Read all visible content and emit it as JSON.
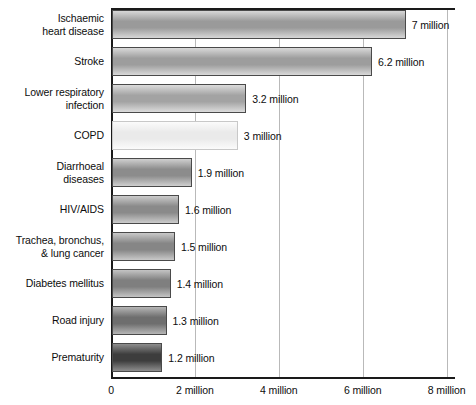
{
  "chart_data": {
    "type": "bar",
    "orientation": "horizontal",
    "title": "",
    "subtitle": "",
    "xlabel": "",
    "ylabel": "",
    "xlim": [
      0,
      8.2
    ],
    "xunit": "million",
    "grid": true,
    "legend": false,
    "categories": [
      "Ischaemic\nheart disease",
      "Stroke",
      "Lower respiratory\ninfection",
      "COPD",
      "Diarrhoeal\ndiseases",
      "HIV/AIDS",
      "Trachea, bronchus,\n& lung cancer",
      "Diabetes mellitus",
      "Road injury",
      "Prematurity"
    ],
    "values": [
      7,
      6.2,
      3.2,
      3,
      1.9,
      1.6,
      1.5,
      1.4,
      1.3,
      1.2
    ],
    "value_labels": [
      "7 million",
      "6.2 million",
      "3.2 million",
      "3 million",
      "1.9 million",
      "1.6 million",
      "1.5 million",
      "1.4 million",
      "1.3 million",
      "1.2 million"
    ],
    "bar_fill_mid": [
      "#9a9a9a",
      "#9d9d9d",
      "#a3a3a3",
      "#eaeaea",
      "#8c8c8c",
      "#8a8a8a",
      "#868686",
      "#7f7f7f",
      "#6e6e6e",
      "#3d3d3d"
    ],
    "bar_fill_edge": [
      "#d7d7d7",
      "#d9d9d9",
      "#dcdcdc",
      "#fbfbfb",
      "#cfcfcf",
      "#cccccc",
      "#c9c9c9",
      "#c4c4c4",
      "#b6b6b6",
      "#8e8e8e"
    ],
    "xticks": [
      0,
      2,
      4,
      6,
      8
    ],
    "xtick_labels": [
      "0",
      "2 million",
      "4 million",
      "6 million",
      "8 million"
    ],
    "gridline_values": [
      2,
      4,
      6,
      8
    ],
    "axis_color": "#1a1a1a",
    "grid_color": "#b9b9b9",
    "text_color": "#0d0d0d",
    "background": "#ffffff"
  }
}
